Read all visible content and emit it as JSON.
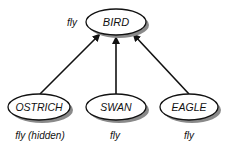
{
  "diagram": {
    "root": {
      "label": "BIRD",
      "property": "fly"
    },
    "children": [
      {
        "label": "OSTRICH",
        "property": "fly (hidden)"
      },
      {
        "label": "SWAN",
        "property": "fly"
      },
      {
        "label": "EAGLE",
        "property": "fly"
      }
    ],
    "edges": [
      {
        "from": "OSTRICH",
        "to": "BIRD"
      },
      {
        "from": "SWAN",
        "to": "BIRD"
      },
      {
        "from": "EAGLE",
        "to": "BIRD"
      }
    ],
    "colors": {
      "stroke": "#111111",
      "shadow": "#8a8a8a",
      "fill": "#ffffff"
    }
  }
}
